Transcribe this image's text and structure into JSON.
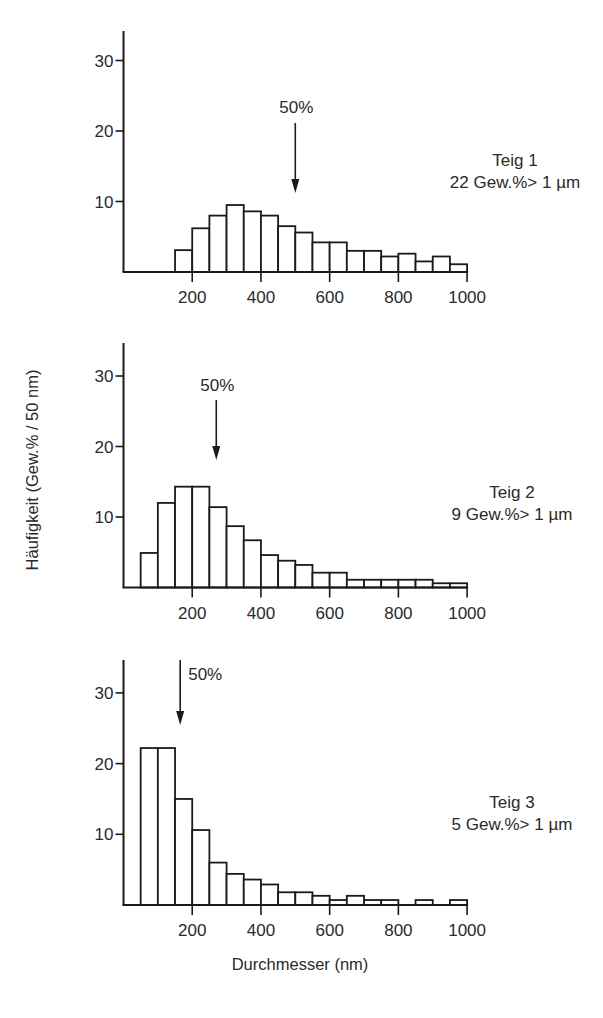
{
  "figure": {
    "y_axis_label": "Häufigkeit (Gew.% / 50 nm)",
    "x_axis_label": "Durchmesser (nm)",
    "stroke_color": "#1a1a1a",
    "background": "#ffffff"
  },
  "panels": [
    {
      "title": "Teig 1",
      "note": "22 Gew.%> 1 µm",
      "median_label": "50%",
      "median_nm": 500
    },
    {
      "title": "Teig 2",
      "note": "9 Gew.%> 1 µm",
      "median_label": "50%",
      "median_nm": 270
    },
    {
      "title": "Teig 3",
      "note": "5 Gew.%> 1 µm",
      "median_label": "50%",
      "median_nm": 165
    }
  ],
  "chart_data": [
    {
      "type": "bar",
      "title": "Teig 1",
      "subtitle": "22 Gew.% > 1 µm",
      "xlabel": "Durchmesser (nm)",
      "ylabel": "Häufigkeit (Gew.% / 50 nm)",
      "bin_width_nm": 50,
      "bin_start_nm": [
        150,
        200,
        250,
        300,
        350,
        400,
        450,
        500,
        550,
        600,
        650,
        700,
        750,
        800,
        850,
        900,
        950
      ],
      "values": [
        3.1,
        6.2,
        8.0,
        9.5,
        8.6,
        8.0,
        6.5,
        5.6,
        4.2,
        4.2,
        3.0,
        3.0,
        2.2,
        2.6,
        1.5,
        2.2,
        1.1
      ],
      "x_ticks": [
        200,
        400,
        600,
        800,
        1000
      ],
      "y_ticks": [
        10,
        20,
        30
      ],
      "xlim": [
        0,
        1000
      ],
      "ylim": [
        0,
        34
      ],
      "annotations": [
        {
          "text": "50%",
          "type": "arrow",
          "x_nm": 500
        }
      ],
      "grid": false
    },
    {
      "type": "bar",
      "title": "Teig 2",
      "subtitle": "9 Gew.% > 1 µm",
      "xlabel": "Durchmesser (nm)",
      "ylabel": "Häufigkeit (Gew.% / 50 nm)",
      "bin_width_nm": 50,
      "bin_start_nm": [
        50,
        100,
        150,
        200,
        250,
        300,
        350,
        400,
        450,
        500,
        550,
        600,
        650,
        700,
        750,
        800,
        850,
        900,
        950
      ],
      "values": [
        4.9,
        12.0,
        14.3,
        14.3,
        11.4,
        8.7,
        6.7,
        4.6,
        3.8,
        3.2,
        2.1,
        2.1,
        1.1,
        1.1,
        1.1,
        1.1,
        1.1,
        0.6,
        0.6
      ],
      "x_ticks": [
        200,
        400,
        600,
        800,
        1000
      ],
      "y_ticks": [
        10,
        20,
        30
      ],
      "xlim": [
        0,
        1000
      ],
      "ylim": [
        0,
        34.5
      ],
      "annotations": [
        {
          "text": "50%",
          "type": "arrow",
          "x_nm": 270
        }
      ],
      "grid": false
    },
    {
      "type": "bar",
      "title": "Teig 3",
      "subtitle": "5 Gew.% > 1 µm",
      "xlabel": "Durchmesser (nm)",
      "ylabel": "Häufigkeit (Gew.% / 50 nm)",
      "bin_width_nm": 50,
      "bin_start_nm": [
        50,
        100,
        150,
        200,
        250,
        300,
        350,
        400,
        450,
        500,
        550,
        600,
        650,
        700,
        750,
        800,
        850,
        900,
        950
      ],
      "values": [
        22.2,
        22.2,
        15.0,
        10.6,
        6.0,
        4.4,
        3.6,
        2.9,
        1.8,
        1.8,
        1.3,
        0.7,
        1.3,
        0.7,
        0.7,
        0,
        0.7,
        0,
        0.7
      ],
      "x_ticks": [
        200,
        400,
        600,
        800,
        1000
      ],
      "y_ticks": [
        10,
        20,
        30
      ],
      "xlim": [
        0,
        1000
      ],
      "ylim": [
        0,
        34.5
      ],
      "annotations": [
        {
          "text": "50%",
          "type": "arrow",
          "x_nm": 165
        }
      ],
      "grid": false
    }
  ]
}
